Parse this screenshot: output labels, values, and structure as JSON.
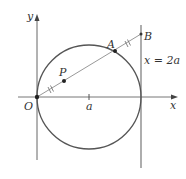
{
  "figure": {
    "labels": {
      "y_axis": "y",
      "x_axis": "x",
      "origin": "O",
      "point_p": "P",
      "point_a": "A",
      "point_b": "B",
      "center_tick": "a",
      "line_eq": "x = 2a"
    },
    "colors": {
      "axis": "#555555",
      "circle": "#555555",
      "line": "#888888",
      "text": "#333333"
    }
  }
}
